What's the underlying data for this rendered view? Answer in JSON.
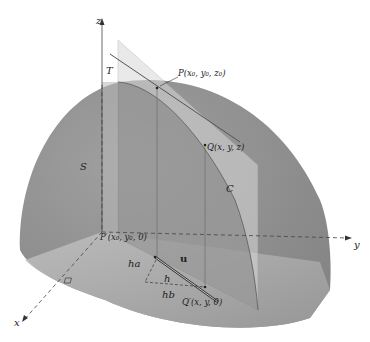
{
  "diagram": {
    "colors": {
      "surface": "#8e8e8e",
      "surface_light": "#a8a8a8",
      "plane": "#cfcfcf",
      "plane_dark": "#7a7a7a",
      "floor": "#b9b9b9",
      "axis": "#444444",
      "background": "#ffffff"
    },
    "axes": {
      "x": "x",
      "y": "y",
      "z": "z"
    },
    "labels": {
      "surface": "S",
      "plane": "T",
      "curve": "C",
      "point_p": "P(x₀, y₀, z₀)",
      "point_q": "Q(x, y, z)",
      "point_p_prime": "P′(x₀, y₀, 0)",
      "point_q_prime": "Q′(x, y, 0)",
      "vector_u": "u",
      "seg_h": "h",
      "seg_ha": "ha",
      "seg_hb": "hb"
    }
  }
}
